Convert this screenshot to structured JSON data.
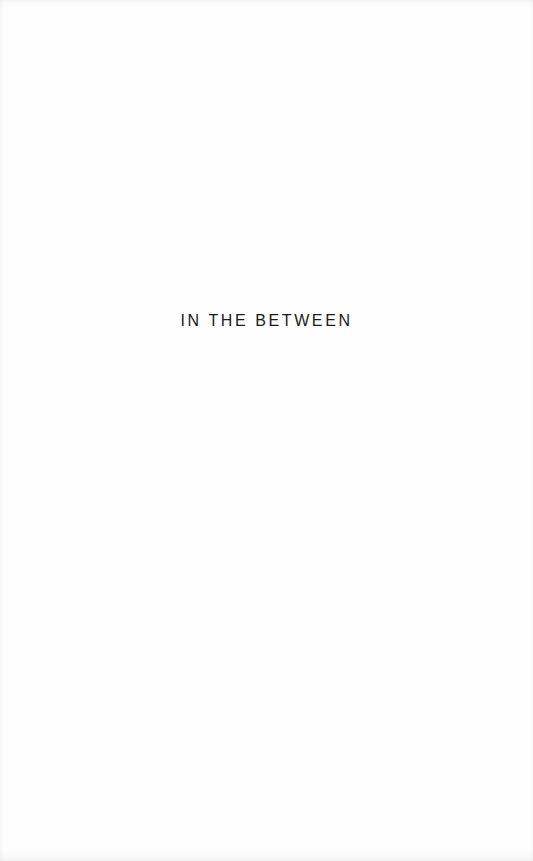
{
  "page": {
    "title": "IN THE BETWEEN",
    "text_color": "#1a1a1a",
    "background_color": "#fefefe"
  }
}
